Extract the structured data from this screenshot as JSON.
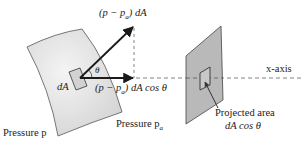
{
  "figure": {
    "labels": {
      "normal_force": "(p − p",
      "normal_force_sub": "a",
      "normal_force_tail": ") dA",
      "x_component": "(p − p",
      "x_component_sub": "a",
      "x_component_tail": ") dA cos θ",
      "theta": "θ",
      "dA": "dA",
      "pressure_p": "Pressure p",
      "pressure_pa": "Pressure p",
      "pressure_pa_sub": "a",
      "x_axis": "x-axis",
      "projected_area_line1": "Projected area",
      "projected_area_line2": "dA cos θ"
    },
    "colors": {
      "surface_fill": "#e4e4e4",
      "plane_fill": "#b9b9b9",
      "stroke": "#333333",
      "arrow": "#1a1a1a",
      "dashed": "#666666"
    }
  }
}
